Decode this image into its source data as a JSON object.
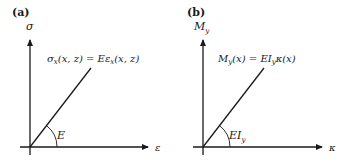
{
  "panels": [
    {
      "id": "a",
      "label": "(a)",
      "y_axis_label": "σ",
      "x_axis_label": "ε",
      "equation": "σ",
      "equation_sub": "x",
      "equation_rest": "(x, z) = Eε",
      "equation_sub2": "x",
      "equation_end": "(x, z)",
      "angle_label": "E",
      "angle_sub": ""
    },
    {
      "id": "b",
      "label": "(b)",
      "y_axis_label": "M",
      "y_axis_sub": "y",
      "x_axis_label": "κ",
      "equation": "M",
      "equation_sub": "y",
      "equation_rest": "(x) = EI",
      "equation_sub2": "y",
      "equation_end": "κ(x)",
      "angle_label": "EI",
      "angle_sub": "y"
    }
  ],
  "colors": {
    "ink": "#1a1a1a",
    "background": "#ffffff"
  }
}
